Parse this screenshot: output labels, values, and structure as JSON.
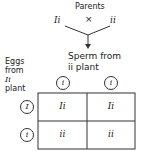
{
  "title": "Parents",
  "parent_left": "Ii",
  "cross_symbol": "×",
  "parent_right": "ii",
  "sperm_label_line1": "Sperm from",
  "sperm_label_line2": "ii plant",
  "eggs_label": [
    "Eggs",
    "from",
    "Ii",
    "plant"
  ],
  "sperm_alleles": [
    "i",
    "i"
  ],
  "egg_alleles": [
    "I",
    "i"
  ],
  "grid": [
    [
      "Ii",
      "Ii"
    ],
    [
      "ii",
      "ii"
    ]
  ]
}
